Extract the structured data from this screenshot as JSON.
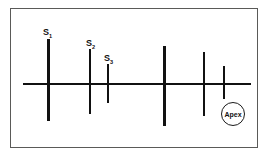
{
  "figure": {
    "background_color": "#ffffff",
    "frame": {
      "border_color": "#5a5a58",
      "x": 10,
      "y": 8,
      "width": 248,
      "height": 140
    },
    "line_color": "#111111"
  },
  "chart_data": {
    "type": "scatter",
    "title": "",
    "xlabel": "",
    "ylabel": "",
    "grid": false,
    "legend": null,
    "axis": {
      "orientation": "horizontal",
      "x_start": 22,
      "x_end": 250,
      "y": 83,
      "thickness": 2,
      "color": "#111111"
    },
    "series": [
      {
        "name": "arrival-markers",
        "description": "Vertical line markers (amplitude spikes) along the horizontal trace axis",
        "points": [
          {
            "id": "m1",
            "label": "S1",
            "label_text": "S",
            "subscript": "1",
            "x": 47,
            "top": 38,
            "bottom": 120,
            "height": 82,
            "thickness": 3,
            "color": "#111111",
            "labeled": true
          },
          {
            "id": "m2",
            "label": "S2",
            "label_text": "S",
            "subscript": "2",
            "x": 89,
            "top": 48,
            "bottom": 113,
            "height": 65,
            "thickness": 2,
            "color": "#111111",
            "labeled": true
          },
          {
            "id": "m3",
            "label": "S3",
            "label_text": "S",
            "subscript": "3",
            "x": 107,
            "top": 63,
            "bottom": 102,
            "height": 39,
            "thickness": 2,
            "color": "#111111",
            "labeled": true
          },
          {
            "id": "m4",
            "label": "",
            "label_text": "",
            "subscript": "",
            "x": 163,
            "top": 45,
            "bottom": 125,
            "height": 80,
            "thickness": 3,
            "color": "#111111",
            "labeled": false
          },
          {
            "id": "m5",
            "label": "",
            "label_text": "",
            "subscript": "",
            "x": 203,
            "top": 51,
            "bottom": 115,
            "height": 64,
            "thickness": 1.5,
            "color": "#111111",
            "labeled": false
          },
          {
            "id": "m6",
            "label": "",
            "label_text": "",
            "subscript": "",
            "x": 223,
            "top": 65,
            "bottom": 98,
            "height": 33,
            "thickness": 1.5,
            "color": "#111111",
            "labeled": false
          }
        ]
      }
    ],
    "labels": [
      {
        "name": "s1-label",
        "text": "S",
        "subscript": "1",
        "x": 42,
        "y": 27
      },
      {
        "name": "s2-label",
        "text": "S",
        "subscript": "2",
        "x": 85,
        "y": 38
      },
      {
        "name": "s3-label",
        "text": "S",
        "subscript": "3",
        "x": 103,
        "y": 53
      }
    ],
    "annotations": [
      {
        "name": "apex",
        "text": "Apex",
        "shape": "circle",
        "cx": 232,
        "cy": 113,
        "r": 12,
        "border_color": "#1a1a1a",
        "text_color": "#111111"
      }
    ]
  }
}
